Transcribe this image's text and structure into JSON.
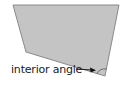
{
  "diagram": {
    "type": "quadrilateral",
    "label": "interior angle",
    "shape": {
      "points": "13,5 119,5 105,76 26,52",
      "fill": "#c4c4c4",
      "stroke": "#8a8a8a"
    },
    "annotation": {
      "target_vertex": "bottom-right",
      "arrow_color": "#111111"
    }
  }
}
